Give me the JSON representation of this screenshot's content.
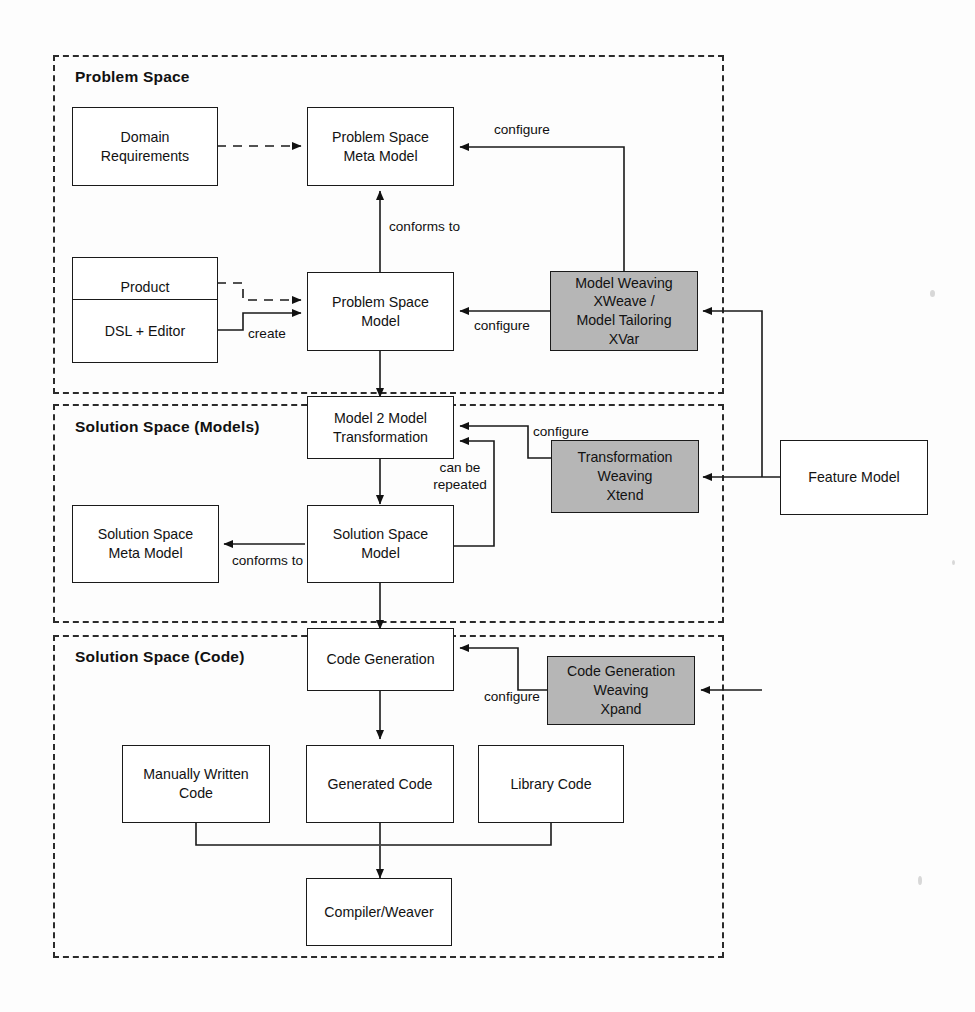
{
  "diagram": {
    "type": "flow-diagram",
    "background_color": "#fdfdfd",
    "shaded_node_color": "#b6b6b6",
    "line_color": "#1a1a1a"
  },
  "groups": [
    {
      "id": "problem-space",
      "label": "Problem Space"
    },
    {
      "id": "solution-space-models",
      "label": "Solution Space (Models)"
    },
    {
      "id": "solution-space-code",
      "label": "Solution Space (Code)"
    }
  ],
  "nodes": [
    {
      "id": "domain-requirements",
      "label": "Domain\nRequirements",
      "shaded": false,
      "group": "problem-space"
    },
    {
      "id": "product-requirements",
      "label": "Product\nRequirements",
      "shaded": false,
      "group": "problem-space"
    },
    {
      "id": "dsl-editor",
      "label": "DSL + Editor",
      "shaded": false,
      "group": "problem-space"
    },
    {
      "id": "problem-space-meta-model",
      "label": "Problem Space\nMeta Model",
      "shaded": false,
      "group": "problem-space"
    },
    {
      "id": "problem-space-model",
      "label": "Problem Space\nModel",
      "shaded": false,
      "group": "problem-space"
    },
    {
      "id": "model-weaving",
      "label": "Model Weaving\nXWeave /\nModel Tailoring\nXVar",
      "shaded": true,
      "group": "problem-space"
    },
    {
      "id": "model-2-model-transformation",
      "label": "Model 2 Model\nTransformation",
      "shaded": false,
      "group": "solution-space-models"
    },
    {
      "id": "solution-space-meta-model",
      "label": "Solution Space\nMeta Model",
      "shaded": false,
      "group": "solution-space-models"
    },
    {
      "id": "solution-space-model",
      "label": "Solution Space\nModel",
      "shaded": false,
      "group": "solution-space-models"
    },
    {
      "id": "transformation-weaving",
      "label": "Transformation\nWeaving\nXtend",
      "shaded": true,
      "group": "solution-space-models"
    },
    {
      "id": "feature-model",
      "label": "Feature Model",
      "shaded": false,
      "group": "none"
    },
    {
      "id": "code-generation",
      "label": "Code Generation",
      "shaded": false,
      "group": "solution-space-code"
    },
    {
      "id": "code-generation-weaving",
      "label": "Code Generation\nWeaving\nXpand",
      "shaded": true,
      "group": "solution-space-code"
    },
    {
      "id": "manually-written-code",
      "label": "Manually Written\nCode",
      "shaded": false,
      "group": "solution-space-code"
    },
    {
      "id": "generated-code",
      "label": "Generated Code",
      "shaded": false,
      "group": "solution-space-code"
    },
    {
      "id": "library-code",
      "label": "Library Code",
      "shaded": false,
      "group": "solution-space-code"
    },
    {
      "id": "compiler-weaver",
      "label": "Compiler/Weaver",
      "shaded": false,
      "group": "solution-space-code"
    }
  ],
  "edges": [
    {
      "id": "e1",
      "from": "domain-requirements",
      "to": "problem-space-meta-model",
      "label": "",
      "style": "dashed"
    },
    {
      "id": "e2",
      "from": "product-requirements",
      "to": "problem-space-model",
      "label": "",
      "style": "dashed"
    },
    {
      "id": "e3",
      "from": "dsl-editor",
      "to": "problem-space-model",
      "label": "create",
      "style": "solid"
    },
    {
      "id": "e4",
      "from": "problem-space-model",
      "to": "problem-space-meta-model",
      "label": "conforms to",
      "style": "solid"
    },
    {
      "id": "e5",
      "from": "model-weaving",
      "to": "problem-space-meta-model",
      "label": "configure",
      "style": "solid"
    },
    {
      "id": "e6",
      "from": "model-weaving",
      "to": "problem-space-model",
      "label": "configure",
      "style": "solid"
    },
    {
      "id": "e7",
      "from": "problem-space-model",
      "to": "model-2-model-transformation",
      "label": "",
      "style": "solid"
    },
    {
      "id": "e8",
      "from": "transformation-weaving",
      "to": "model-2-model-transformation",
      "label": "configure",
      "style": "solid"
    },
    {
      "id": "e9",
      "from": "model-2-model-transformation",
      "to": "solution-space-model",
      "label": "",
      "style": "solid"
    },
    {
      "id": "e10",
      "from": "solution-space-model",
      "to": "model-2-model-transformation",
      "label": "can be\nrepeated",
      "style": "solid"
    },
    {
      "id": "e11",
      "from": "solution-space-model",
      "to": "solution-space-meta-model",
      "label": "conforms to",
      "style": "solid"
    },
    {
      "id": "e12",
      "from": "solution-space-model",
      "to": "code-generation",
      "label": "",
      "style": "solid"
    },
    {
      "id": "e13",
      "from": "code-generation-weaving",
      "to": "code-generation",
      "label": "configure",
      "style": "solid"
    },
    {
      "id": "e14",
      "from": "feature-model",
      "to": "model-weaving",
      "label": "",
      "style": "solid"
    },
    {
      "id": "e15",
      "from": "feature-model",
      "to": "transformation-weaving",
      "label": "",
      "style": "solid"
    },
    {
      "id": "e16",
      "from": "feature-model",
      "to": "code-generation-weaving",
      "label": "",
      "style": "solid"
    },
    {
      "id": "e17",
      "from": "code-generation",
      "to": "generated-code",
      "label": "",
      "style": "solid"
    },
    {
      "id": "e18",
      "from": "manually-written-code",
      "to": "compiler-weaver",
      "label": "",
      "style": "solid"
    },
    {
      "id": "e19",
      "from": "generated-code",
      "to": "compiler-weaver",
      "label": "",
      "style": "solid"
    },
    {
      "id": "e20",
      "from": "library-code",
      "to": "compiler-weaver",
      "label": "",
      "style": "solid"
    }
  ],
  "edge_labels": {
    "configure_meta": "configure",
    "configure_psm": "configure",
    "configure_m2m": "configure",
    "configure_codegen": "configure",
    "conforms_to_top": "conforms to",
    "conforms_to_solution": "conforms to",
    "create": "create",
    "can_be_repeated": "can be\nrepeated"
  }
}
